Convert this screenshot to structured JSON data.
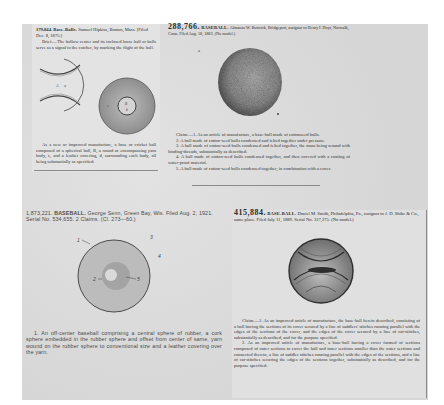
{
  "clippings": [
    {
      "id": "clip-1",
      "patent_number": "179,844.",
      "title": "Base-Balls.",
      "inventor_line": "Samuel Hipkiss, Boston, Mass. [Filed Dec. 8, 1875.]",
      "brief": "Brief.—The hollow center and its inclosed loose ball or balls serve as a signal to the catcher, by marking the flight of the ball.",
      "figure_labels": [
        "A",
        "a",
        "B",
        "b",
        "c"
      ],
      "claim": "As a new or improved manufacture, a base or cricket ball composed of a spherical ball, B, a round or encompassing yarn body, c, and a leather covering, d, surrounding each body, all being substantially as specified."
    },
    {
      "id": "clip-2",
      "patent_number": "288,766.",
      "title": "BASEBALL.",
      "inventor_line": "Almanzo W. Botwick, Bridgeport, assignor to Henry I. Hoyt, Norwalk, Conn. Filed Aug. 18, 1883. (No model.)",
      "figure_label": "a",
      "claims": [
        "Claim.—1. As an article of manufacture, a base-ball made of cottonseed hulls.",
        "2. A ball made of cotton-seed hulls condensed and felted together under pressure.",
        "3. A ball made of cotton-seed hulls condensed and felted together, the mass being wound with binding-threads, substantially as described.",
        "4. A ball made of cotton-seed hulls condensed together, and then covered with a coating of water-proof material.",
        "5. A ball made of cotton-seed hulls condensed together, in combination with a cover."
      ]
    },
    {
      "id": "clip-3",
      "patent_number": "1,873,221.",
      "title": "BASEBALL.",
      "inventor_line": "George Senn, Green Bay, Wis. Filed Aug. 2, 1921. Serial No. 534,655. 2 Claims. (Cl. 273—60.)",
      "figure_labels": [
        "1",
        "2",
        "3",
        "4",
        "5"
      ],
      "claim": "1. An off-center baseball comprising a central sphere of rubber, a cork sphere embedded in the rubber sphere and offset from center of same, yarn wound on the rubber sphere to conventional size and a leather covering over the yarn."
    },
    {
      "id": "clip-4",
      "patent_number": "415,884.",
      "title": "BASE-BALL.",
      "inventor_line": "Daniel M. Smith, Philadelphia, Pa., assignor to J. D. Shibe & Co., same place. Filed July 11, 1889. Serial No. 317,275. (No model.)",
      "claims": [
        "Claim.—1. As an improved article of manufacture, the base-ball herein described, consisting of a ball having the sections of its cover secured by a line of saddlers' stitches running parallel with the edges of the sections of the cover, and the edges of the cover secured by a line of cat-stitches, substantially as described, and for the purpose specified.",
        "2. As an improved article of manufacture, a base-ball having a cover formed of sections composed of outer sections to cover the ball and inner sections smaller than the outer sections and connected thereto, a line of saddler stitches running parallel with the edges of the sections, and a line of cat-stitches securing the edges of the sections together, substantially as described, and for the purpose specified."
      ]
    }
  ],
  "colors": {
    "page_background": "#ffffff",
    "sheet_background": "#dcdcdc",
    "ink": "#2a2a2a"
  }
}
